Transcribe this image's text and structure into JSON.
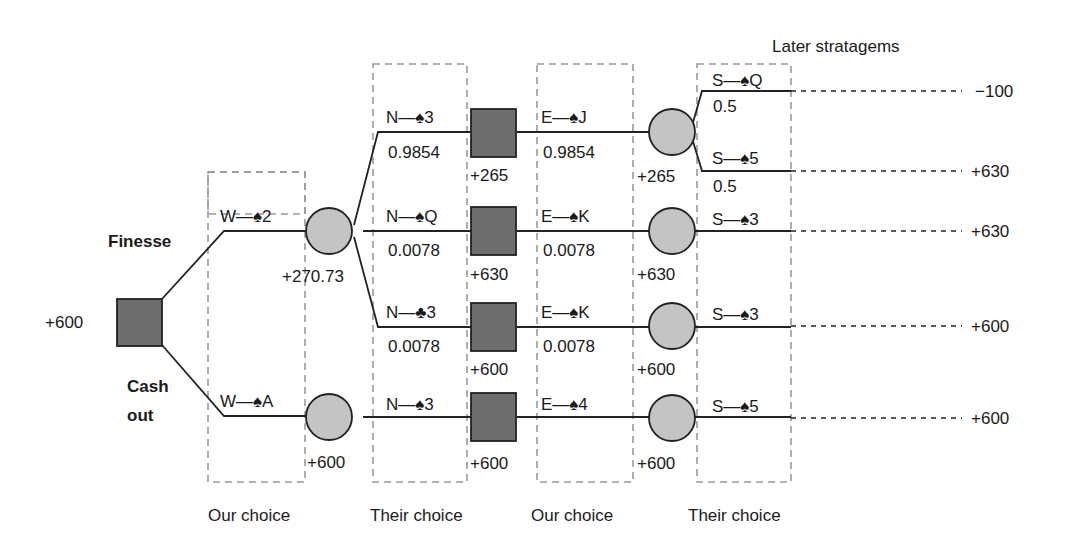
{
  "title": "Later stratagems",
  "root": {
    "value": "+600"
  },
  "choices": {
    "finesse": "Finesse",
    "cash_out_line1": "Cash",
    "cash_out_line2": "out"
  },
  "columns": [
    {
      "label": "Our choice"
    },
    {
      "label": "Their choice"
    },
    {
      "label": "Our choice"
    },
    {
      "label": "Their choice"
    }
  ],
  "level1": [
    {
      "move": "W—♠2",
      "value": "+270.73"
    },
    {
      "move": "W—♠A",
      "value": "+600"
    }
  ],
  "level2": [
    {
      "move": "N—♠3",
      "prob": "0.9854",
      "value": "+265"
    },
    {
      "move": "N—♠Q",
      "prob": "0.0078",
      "value": "+630"
    },
    {
      "move": "N—♣3",
      "prob": "0.0078",
      "value": "+600"
    },
    {
      "move": "N—♠3",
      "prob": "",
      "value": "+600"
    }
  ],
  "level3": [
    {
      "move": "E—♠J",
      "prob": "0.9854",
      "value": "+265"
    },
    {
      "move": "E—♠K",
      "prob": "0.0078",
      "value": "+630"
    },
    {
      "move": "E—♠K",
      "prob": "0.0078",
      "value": "+600"
    },
    {
      "move": "E—♠4",
      "prob": "",
      "value": "+600"
    }
  ],
  "level4": [
    {
      "move": "S—♠Q",
      "prob": "0.5",
      "outcome": "−100"
    },
    {
      "move": "S—♠5",
      "prob": "0.5",
      "outcome": "+630"
    },
    {
      "move": "S—♠3",
      "prob": "",
      "outcome": "+630"
    },
    {
      "move": "S—♠3",
      "prob": "",
      "outcome": "+600"
    },
    {
      "move": "S—♠5",
      "prob": "",
      "outcome": "+600"
    }
  ],
  "colors": {
    "decision_fill": "#6e6e6e",
    "chance_fill": "#c4c4c4",
    "line": "#222222",
    "dashed_box": "#9a9a9a"
  }
}
